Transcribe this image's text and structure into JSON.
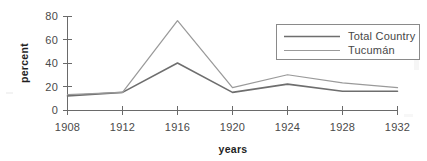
{
  "chart_data": {
    "type": "line",
    "title": "",
    "xlabel": "years",
    "ylabel": "percent",
    "x": [
      1908,
      1912,
      1916,
      1920,
      1924,
      1928,
      1932
    ],
    "xticklabels": [
      "1908",
      "1912",
      "1916",
      "1920",
      "1924",
      "1928",
      "1932"
    ],
    "yticklabels": [
      "0",
      "20",
      "40",
      "60",
      "80"
    ],
    "yticks": [
      0,
      20,
      40,
      60,
      80
    ],
    "ylim": [
      0,
      80
    ],
    "xlim": [
      1908,
      1932
    ],
    "grid": false,
    "legend_position": "upper right",
    "series": [
      {
        "name": "Total Country",
        "values": [
          12,
          15,
          40,
          15,
          22,
          16,
          16
        ],
        "color": "#6e6e6e"
      },
      {
        "name": "Tucumán",
        "values": [
          13,
          15,
          76,
          19,
          30,
          23,
          19
        ],
        "color": "#9a9a9a"
      }
    ]
  },
  "axes": {
    "y_axis_title": "percent",
    "x_axis_title": "years",
    "y_tick_0": "0",
    "y_tick_20": "20",
    "y_tick_40": "40",
    "y_tick_60": "60",
    "y_tick_80": "80",
    "x_tick_1908": "1908",
    "x_tick_1912": "1912",
    "x_tick_1916": "1916",
    "x_tick_1920": "1920",
    "x_tick_1924": "1924",
    "x_tick_1928": "1928",
    "x_tick_1932": "1932"
  },
  "legend": {
    "entries": [
      {
        "label": "Total Country"
      },
      {
        "label": "Tucumán"
      }
    ]
  },
  "colors": {
    "background": "#ffffff",
    "axis": "#6a6a6a",
    "text": "#4a4a4a",
    "series_total_country": "#6e6e6e",
    "series_tucuman": "#9a9a9a",
    "legend_border": "#8a8a8a"
  }
}
